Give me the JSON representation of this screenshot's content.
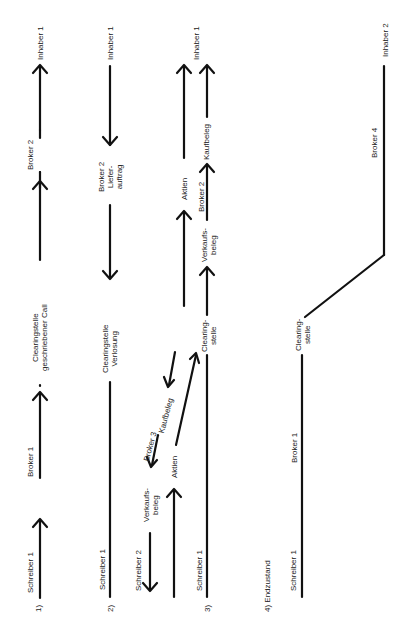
{
  "diagram": {
    "orientation": "rotated 90deg counter-clockwise",
    "panels": [
      {
        "id": "1",
        "number": "1)",
        "nodes": [
          "Schreiber 1",
          "Broker 1",
          "Clearingstelle\ngeschriebener Call",
          "Broker 2",
          "Inhaber 1"
        ],
        "flow": "Schreiber 1 → Broker 1 → Clearingstelle geschriebener Call → Broker 2 → Inhaber 1"
      },
      {
        "id": "2",
        "number": "2)",
        "nodes": [
          "Schreiber 1",
          "Clearingstelle\nVerlosung",
          "Broker 2\nLiefer-\nauftrag",
          "Inhaber 1"
        ],
        "flow": "Inhaber 1 → Broker 2 Lieferauftrag → Clearingstelle Verlosung — Schreiber 1"
      },
      {
        "id": "3",
        "number": "3)",
        "nodes": [
          "Schreiber 2",
          "Verkaufs-\nbeleg",
          "Broker 3",
          "Kaufbeleg",
          "Aktien",
          "Schreiber 1",
          "Clearing-\nstelle",
          "Verkaufs-\nbeleg",
          "Broker 2",
          "Kaufbeleg",
          "Aktien",
          "Inhaber 1"
        ],
        "flow": "Aktien: Schreiber 2 → Broker 3 → Clearingstelle → Broker 2 → Inhaber 1; Belege flow in opposite direction"
      },
      {
        "id": "4",
        "number": "4) Endzustand",
        "nodes": [
          "Schreiber 1",
          "Broker 1",
          "Clearing-\nstelle",
          "Broker 4",
          "Inhaber 2"
        ],
        "flow": "Schreiber 1 — Broker 1 — Clearingstelle — Broker 4 — Inhaber 2"
      }
    ]
  },
  "labels": {
    "p1_num": "1)",
    "p1_schreiber": "Schreiber 1",
    "p1_broker1": "Broker 1",
    "p1_clearing": "Clearingstelle\ngeschriebener Call",
    "p1_broker2": "Broker 2",
    "p1_inhaber": "Inhaber 1",
    "p2_num": "2)",
    "p2_schreiber": "Schreiber 1",
    "p2_clearing": "Clearingstelle\nVerlosung",
    "p2_broker2": "Broker 2\nLiefer-\nauftrag",
    "p2_inhaber": "Inhaber 1",
    "p3_num": "3)",
    "p3_schreiber2": "Schreiber 2",
    "p3_verkaufsbeleg1": "Verkaufs-\nbeleg",
    "p3_broker3": "Broker 3",
    "p3_kaufbeleg1": "Kaufbeleg",
    "p3_aktien1": "Aktien",
    "p3_schreiber1": "Schreiber 1",
    "p3_clearing": "Clearing-\nstelle",
    "p3_verkaufsbeleg2": "Verkaufs-\nbeleg",
    "p3_broker2": "Broker 2",
    "p3_kaufbeleg2": "Kaufbeleg",
    "p3_aktien2": "Aktien",
    "p3_inhaber": "Inhaber 1",
    "p4_num": "4) Endzustand",
    "p4_schreiber": "Schreiber 1",
    "p4_broker1": "Broker 1",
    "p4_clearing": "Clearing-\nstelle",
    "p4_broker4": "Broker 4",
    "p4_inhaber": "Inhaber 2"
  }
}
